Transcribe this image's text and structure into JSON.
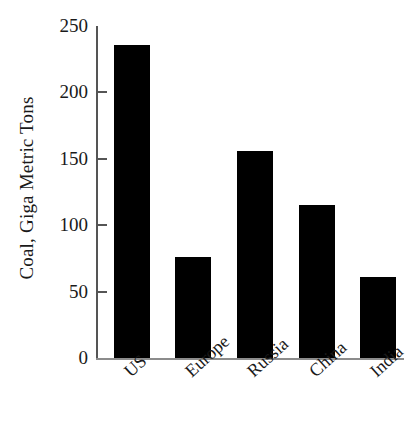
{
  "chart_data": {
    "type": "bar",
    "title": "",
    "xlabel": "",
    "ylabel": "Coal, Giga Metric Tons",
    "categories": [
      "US",
      "Europe",
      "Russia",
      "China",
      "India"
    ],
    "values": [
      236,
      76,
      156,
      115,
      61
    ],
    "ylim": [
      0,
      250
    ],
    "yticks": [
      0,
      50,
      100,
      150,
      200,
      250
    ],
    "ytick_labels": [
      "0",
      "50",
      "100",
      "150",
      "200",
      "250"
    ],
    "grid": false,
    "legend": false,
    "legend_position": "none",
    "bar_color": "#000000",
    "axis_color": "#555555",
    "background_color": "#ffffff",
    "xtick_rotation": 42
  },
  "axis": {
    "y_title": "Coal, Giga Metric Tons"
  }
}
